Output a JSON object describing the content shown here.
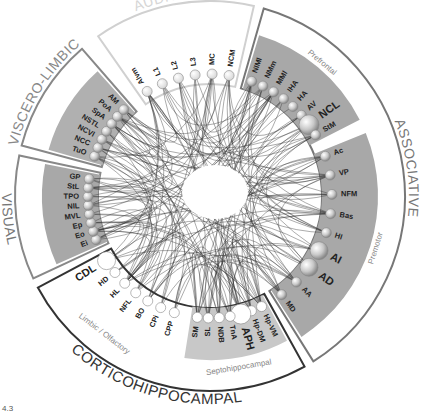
{
  "figure_label": "4.3",
  "center": {
    "x": 210,
    "y": 196
  },
  "modules": [
    {
      "id": "auditory",
      "title": "AUDITORY",
      "title_color": "#d6d6d6",
      "band_color": "#ffffff",
      "border_color": "#d0d0d0",
      "start": -125,
      "end": -77,
      "nodes": [
        {
          "label": "Alvm",
          "size": 5
        },
        {
          "label": "L1",
          "size": 5
        },
        {
          "label": "L2",
          "size": 5
        },
        {
          "label": "L3",
          "size": 5
        },
        {
          "label": "MC",
          "size": 5
        },
        {
          "label": "NCM",
          "size": 5
        }
      ],
      "node_fill": "#f2f2f2"
    },
    {
      "id": "associative",
      "title": "ASSOCIATIVE",
      "title_color": "#777777",
      "band_color": "#a8a8a8",
      "border_color": "#777777",
      "start": -74,
      "end": 58,
      "subregions": [
        {
          "label": "Prefrontal",
          "start": -74,
          "end": -26,
          "nodes": [
            {
              "label": "NIMl",
              "size": 5
            },
            {
              "label": "NMm",
              "size": 5
            },
            {
              "label": "MMl",
              "size": 5
            },
            {
              "label": "IHA",
              "size": 5
            },
            {
              "label": "HA",
              "size": 5
            },
            {
              "label": "AV",
              "size": 5
            },
            {
              "label": "NCL",
              "size": 10
            },
            {
              "label": "StM",
              "size": 5
            }
          ]
        },
        {
          "label": "Premotor",
          "start": -23,
          "end": 58,
          "nodes": [
            {
              "label": "Ac",
              "size": 5
            },
            {
              "label": "VP",
              "size": 5
            },
            {
              "label": "NFM",
              "size": 5
            },
            {
              "label": "Bas",
              "size": 5
            },
            {
              "label": "HI",
              "size": 5
            },
            {
              "label": "AI",
              "size": 9
            },
            {
              "label": "AD",
              "size": 9
            },
            {
              "label": "AA",
              "size": 5
            },
            {
              "label": "MD",
              "size": 5
            }
          ]
        }
      ],
      "node_fill": "#d8d8d8"
    },
    {
      "id": "corticohippocampal",
      "title": "CORTICOHIPPOCAMPAL",
      "title_color": "#333333",
      "band_color": "#ffffff",
      "border_color": "#333333",
      "start": 61,
      "end": 152,
      "subregions": [
        {
          "label": "Septohippocampal",
          "start": 61,
          "end": 100,
          "nodes": [
            {
              "label": "Hp-VM",
              "size": 5
            },
            {
              "label": "Hp-DM",
              "size": 5
            },
            {
              "label": "APH",
              "size": 10
            },
            {
              "label": "TnA",
              "size": 5
            },
            {
              "label": "NDB",
              "size": 5
            },
            {
              "label": "SL",
              "size": 5
            },
            {
              "label": "SM",
              "size": 5
            }
          ]
        },
        {
          "label": "Limbic / Olfactory",
          "start": 103,
          "end": 152,
          "nodes": [
            {
              "label": "CPP",
              "size": 5
            },
            {
              "label": "CPi",
              "size": 5
            },
            {
              "label": "BO",
              "size": 5
            },
            {
              "label": "NFL",
              "size": 5
            },
            {
              "label": "HL",
              "size": 5
            },
            {
              "label": "HD",
              "size": 5
            },
            {
              "label": "CDL",
              "size": 9
            }
          ]
        }
      ],
      "node_fill": "#ffffff"
    },
    {
      "id": "visual",
      "title": "VISUAL",
      "title_color": "#777777",
      "band_color": "#a8a8a8",
      "border_color": "#888888",
      "start": 155,
      "end": 192,
      "nodes": [
        {
          "label": "Ei",
          "size": 5
        },
        {
          "label": "Eo",
          "size": 5
        },
        {
          "label": "Ep",
          "size": 5
        },
        {
          "label": "MVL",
          "size": 5
        },
        {
          "label": "NIL",
          "size": 5
        },
        {
          "label": "TPO",
          "size": 5
        },
        {
          "label": "StL",
          "size": 5
        },
        {
          "label": "GP",
          "size": 5
        }
      ],
      "node_fill": "#d8d8d8"
    },
    {
      "id": "viscero-limbic",
      "title": "VISCERO-LIMBIC",
      "title_color": "#888888",
      "band_color": "#b0b0b0",
      "border_color": "#888888",
      "start": 195,
      "end": 229,
      "nodes": [
        {
          "label": "TuO",
          "size": 5
        },
        {
          "label": "NCC",
          "size": 5
        },
        {
          "label": "NCVl",
          "size": 5
        },
        {
          "label": "NSTL",
          "size": 5
        },
        {
          "label": "SpA",
          "size": 5
        },
        {
          "label": "PoA",
          "size": 5
        },
        {
          "label": "AM",
          "size": 5
        }
      ],
      "node_fill": "#d8d8d8"
    }
  ],
  "edge_color": "#333333"
}
